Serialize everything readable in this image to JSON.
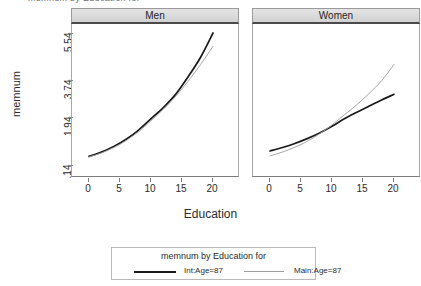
{
  "clipped_title": "memnum by Education for",
  "axes": {
    "ylabel": "memnum",
    "xlabel": "Education",
    "yticks": [
      ".14",
      "1.94",
      "3.74",
      "5.54"
    ],
    "xticks": [
      "0",
      "5",
      "10",
      "15",
      "20"
    ]
  },
  "panels": [
    {
      "title": "Men"
    },
    {
      "title": "Women"
    }
  ],
  "legend": {
    "title": "memnum by Education for",
    "entries": [
      {
        "label": "Int:Age=87",
        "color": "#1a1a1a",
        "style": "thick"
      },
      {
        "label": "Main:Age=87",
        "color": "#9d9d9d",
        "style": "thin"
      }
    ]
  },
  "chart_data": {
    "type": "line",
    "title": "memnum by Education for",
    "xlabel": "Education",
    "ylabel": "memnum",
    "xlim": [
      -1,
      22
    ],
    "ylim": [
      0.14,
      6.2
    ],
    "grid": false,
    "legend_position": "bottom",
    "panels": [
      {
        "name": "Men",
        "x": [
          0,
          2,
          4,
          6,
          8,
          10,
          12,
          14,
          16,
          18,
          20
        ],
        "series": [
          {
            "name": "Int:Age=87",
            "color": "#1a1a1a",
            "values": [
              0.46,
              0.62,
              0.83,
              1.1,
              1.44,
              1.86,
              2.38,
              3.03,
              3.85,
              4.6,
              5.54
            ]
          },
          {
            "name": "Main:Age=87",
            "color": "#9d9d9d",
            "values": [
              0.44,
              0.59,
              0.79,
              1.05,
              1.38,
              1.79,
              2.3,
              2.93,
              3.66,
              4.32,
              5.02
            ]
          }
        ]
      },
      {
        "name": "Women",
        "x": [
          0,
          2,
          4,
          6,
          8,
          10,
          12,
          14,
          16,
          18,
          20
        ],
        "series": [
          {
            "name": "Int:Age=87",
            "color": "#1a1a1a",
            "values": [
              0.66,
              0.79,
              0.94,
              1.12,
              1.33,
              1.58,
              1.86,
              2.15,
              2.45,
              2.75,
              3.02
            ]
          },
          {
            "name": "Main:Age=87",
            "color": "#9d9d9d",
            "values": [
              0.48,
              0.62,
              0.8,
              1.02,
              1.3,
              1.63,
              2.03,
              2.51,
              3.07,
              3.68,
              4.32
            ]
          }
        ]
      }
    ]
  },
  "geometry": {
    "panel_left_x": 71,
    "panel_right_x": 252,
    "panel_width": 168,
    "plot_top": 24,
    "plot_height": 153,
    "y_px": {
      "0.14": 165,
      "1.94": 116.6,
      "3.74": 79.5,
      "5.54": 33
    },
    "x_px": {
      "0": 17,
      "5": 48,
      "10": 79,
      "15": 110,
      "20": 141
    }
  }
}
